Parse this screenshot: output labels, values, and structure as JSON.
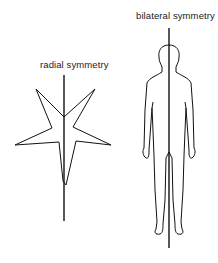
{
  "diagram": {
    "radial": {
      "label": "radial symmetry",
      "figure": "starfish outline",
      "axis": "vertical line of symmetry"
    },
    "bilateral": {
      "label": "bilateral symmetry",
      "figure": "human body outline",
      "axis": "vertical line of symmetry"
    },
    "colors": {
      "stroke": "#111111",
      "background": "#ffffff"
    }
  }
}
